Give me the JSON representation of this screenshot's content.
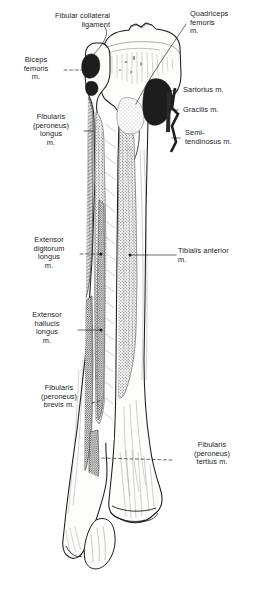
{
  "figure": {
    "view": "anterior",
    "bones": [
      "tibia",
      "fibula"
    ],
    "background_color": "#ffffff",
    "ink_color": "#1b1b1f",
    "bone_fill": "#fdfdfb",
    "muscle_area_fill": "#b9b9b9",
    "dark_attachment_fill": "#1d1d1d",
    "stipple_fill": "#c9c9c9"
  },
  "labels": {
    "fibular_collateral_ligament": {
      "text": "Fibular collateral\nligament",
      "side": "left",
      "align": "right"
    },
    "quadriceps_femoris": {
      "text": "Quadriceps\nfemoris\nm.",
      "side": "right",
      "align": "left"
    },
    "biceps_femoris": {
      "text": "Biceps\nfemoris\nm.",
      "side": "left",
      "align": "center"
    },
    "sartorius": {
      "text": "Sartorius m.",
      "side": "right",
      "align": "left"
    },
    "gracilis": {
      "text": "Gracilis m.",
      "side": "right",
      "align": "left"
    },
    "semitendinosus": {
      "text": "Semi-\ntendinosus m.",
      "side": "right",
      "align": "left"
    },
    "fibularis_peroneus_longus": {
      "text": "Fibularis\n(peroneus)\nlongus\nm.",
      "side": "left",
      "align": "center"
    },
    "extensor_digitorum_longus": {
      "text": "Extensor\ndigitorum\nlongus\nm.",
      "side": "left",
      "align": "center"
    },
    "tibialis_anterior": {
      "text": "Tibialis anterior\nm.",
      "side": "right",
      "align": "left"
    },
    "extensor_hallucis_longus": {
      "text": "Extensor\nhallucis\nlongus\nm.",
      "side": "left",
      "align": "center"
    },
    "fibularis_peroneus_brevis": {
      "text": "Fibularis\n(peroneus)\nbrevis m.",
      "side": "left",
      "align": "center"
    },
    "fibularis_peroneus_tertius": {
      "text": "Fibularis\n(peroneus)\ntertius m.",
      "side": "right",
      "align": "center"
    }
  }
}
